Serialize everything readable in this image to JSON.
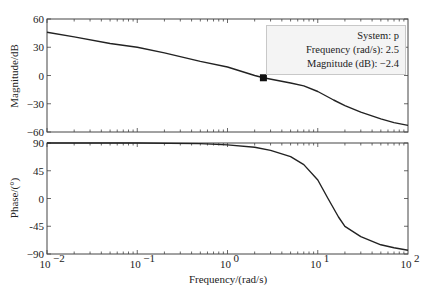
{
  "chart_data": [
    {
      "type": "line",
      "panel": "magnitude",
      "ylabel": "Magnitude/dB",
      "xlabel": "",
      "xscale": "log",
      "xlim": [
        0.01,
        100
      ],
      "ylim": [
        -60,
        60
      ],
      "yticks": [
        60,
        30,
        0,
        -30,
        -60
      ],
      "ytick_labels": [
        "60",
        "30",
        "0",
        "−30",
        "−60"
      ],
      "grid": false,
      "series": [
        {
          "name": "p",
          "x": [
            0.01,
            0.02,
            0.05,
            0.1,
            0.2,
            0.5,
            1,
            2,
            2.5,
            5,
            7,
            10,
            15,
            20,
            30,
            50,
            70,
            100
          ],
          "values": [
            46,
            41,
            34,
            30,
            24,
            15,
            9,
            0,
            -2.4,
            -8,
            -11,
            -17,
            -26,
            -32,
            -39,
            -46,
            -50,
            -53
          ]
        }
      ],
      "datatip": {
        "system": "p",
        "frequency": 2.5,
        "magnitude_db": -2.4
      }
    },
    {
      "type": "line",
      "panel": "phase",
      "ylabel": "Phase/(°)",
      "xlabel": "Frequency/(rad/s)",
      "xscale": "log",
      "xlim": [
        0.01,
        100
      ],
      "ylim": [
        -90,
        90
      ],
      "yticks": [
        90,
        45,
        0,
        -45,
        -90
      ],
      "ytick_labels": [
        "90",
        "45",
        "0",
        "-45",
        "−90"
      ],
      "xtick_labels": [
        "10^-2",
        "10^-1",
        "10^0",
        "10^1",
        "10^2"
      ],
      "grid": false,
      "series": [
        {
          "name": "p",
          "x": [
            0.01,
            0.1,
            0.5,
            1,
            2,
            3,
            5,
            7,
            10,
            13,
            17,
            20,
            30,
            50,
            70,
            100
          ],
          "values": [
            90,
            90,
            89,
            87,
            83,
            78,
            68,
            55,
            30,
            0,
            -30,
            -45,
            -62,
            -75,
            -80,
            -84
          ]
        }
      ]
    }
  ],
  "datatip": {
    "line1": "System: p",
    "line2": "Frequency (rad/s): 2.5",
    "line3": "Magnitude (dB): −2.4"
  },
  "labels": {
    "mag_ylabel": "Magnitude/dB",
    "phase_ylabel": "Phase/(°)",
    "xlabel": "Frequency/(rad/s)"
  }
}
